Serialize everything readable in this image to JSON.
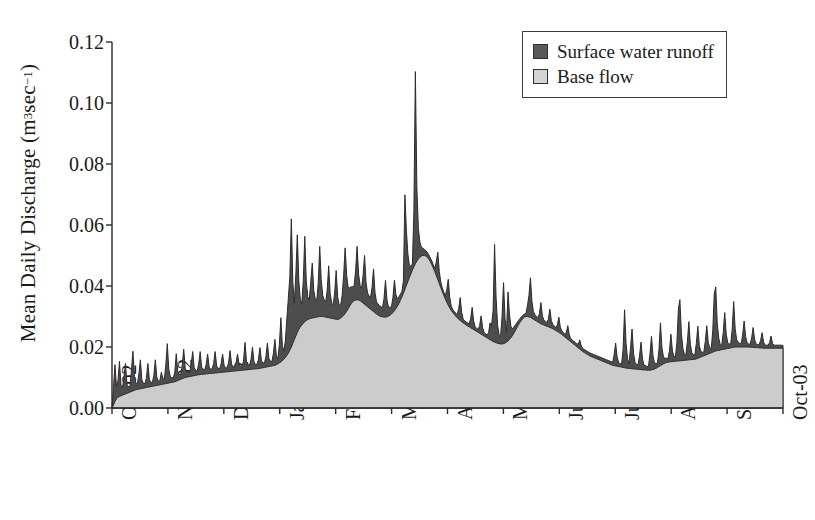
{
  "chart_data": {
    "type": "area",
    "title": "",
    "xlabel": "",
    "ylabel_text": "Mean Daily Discharge (m",
    "ylabel_unit_exp1": "3",
    "ylabel_unit_mid": " sec",
    "ylabel_unit_exp2": "−1",
    "ylabel_close": ")",
    "ylabel_full": "Mean Daily Discharge (m3 sec-1)",
    "ylim": [
      0.0,
      0.12
    ],
    "ytick_labels": [
      "0.12",
      "0.10",
      "0.08",
      "0.06",
      "0.04",
      "0.02",
      "0.00"
    ],
    "ytick_values": [
      0.12,
      0.1,
      0.08,
      0.06,
      0.04,
      0.02,
      0.0
    ],
    "xtick_labels": [
      "Oct-02",
      "Nov-02",
      "Dec-02",
      "Jan-03",
      "Feb-03",
      "Mar-03",
      "Apr-03",
      "May-03",
      "Jun-03",
      "Jul-03",
      "Aug-03",
      "Sep-03",
      "Oct-03"
    ],
    "grid": false,
    "legend_position": "top-right",
    "legend": [
      {
        "label": "Surface water runoff",
        "color": "#595959"
      },
      {
        "label": "Base flow",
        "color": "#d4d4d4"
      }
    ],
    "series": [
      {
        "name": "Base flow",
        "color": "#cccccc",
        "stack_order": 1,
        "values": [
          0.0,
          0.001,
          0.0022,
          0.003,
          0.0035,
          0.0038,
          0.004,
          0.0042,
          0.0044,
          0.0046,
          0.0048,
          0.005,
          0.0052,
          0.0054,
          0.0056,
          0.0058,
          0.006,
          0.0061,
          0.0062,
          0.0063,
          0.0064,
          0.0065,
          0.0066,
          0.0067,
          0.0068,
          0.0069,
          0.007,
          0.0071,
          0.0072,
          0.0073,
          0.0074,
          0.0075,
          0.0076,
          0.0077,
          0.0078,
          0.0079,
          0.008,
          0.0081,
          0.0082,
          0.0083,
          0.0084,
          0.0085,
          0.0086,
          0.0088,
          0.009,
          0.0092,
          0.0094,
          0.0096,
          0.0098,
          0.01,
          0.0101,
          0.0102,
          0.0103,
          0.0104,
          0.0105,
          0.0106,
          0.0107,
          0.0108,
          0.0109,
          0.011,
          0.011,
          0.0111,
          0.0111,
          0.0112,
          0.0112,
          0.0113,
          0.0113,
          0.0114,
          0.0114,
          0.0115,
          0.0115,
          0.0116,
          0.0116,
          0.0117,
          0.0117,
          0.0118,
          0.0118,
          0.0119,
          0.0119,
          0.012,
          0.012,
          0.0121,
          0.0121,
          0.0122,
          0.0122,
          0.0123,
          0.0123,
          0.0124,
          0.0124,
          0.0125,
          0.0125,
          0.0126,
          0.0126,
          0.0127,
          0.0127,
          0.0128,
          0.0128,
          0.0129,
          0.0129,
          0.013,
          0.0131,
          0.0132,
          0.0133,
          0.0134,
          0.0135,
          0.0136,
          0.0137,
          0.0138,
          0.0139,
          0.014,
          0.0142,
          0.0145,
          0.0148,
          0.0151,
          0.0155,
          0.016,
          0.0165,
          0.0172,
          0.018,
          0.019,
          0.02,
          0.0212,
          0.0224,
          0.0236,
          0.0248,
          0.0258,
          0.0266,
          0.0272,
          0.0278,
          0.0283,
          0.0287,
          0.029,
          0.0292,
          0.0294,
          0.0295,
          0.0296,
          0.0297,
          0.0298,
          0.0299,
          0.03,
          0.03,
          0.03,
          0.0299,
          0.0298,
          0.0297,
          0.0296,
          0.0295,
          0.0294,
          0.0293,
          0.0292,
          0.0291,
          0.029,
          0.0292,
          0.0295,
          0.0299,
          0.0304,
          0.031,
          0.0317,
          0.0325,
          0.0334,
          0.0342,
          0.0348,
          0.0352,
          0.0354,
          0.0355,
          0.0354,
          0.0352,
          0.0348,
          0.0344,
          0.034,
          0.0336,
          0.0332,
          0.0328,
          0.0324,
          0.032,
          0.0316,
          0.0312,
          0.0308,
          0.0305,
          0.0302,
          0.03,
          0.0299,
          0.0298,
          0.0298,
          0.0299,
          0.0301,
          0.0304,
          0.0308,
          0.0313,
          0.0319,
          0.0326,
          0.0334,
          0.0343,
          0.0353,
          0.0364,
          0.0376,
          0.0389,
          0.0402,
          0.0415,
          0.0428,
          0.044,
          0.0452,
          0.0463,
          0.0473,
          0.0482,
          0.0489,
          0.0494,
          0.0498,
          0.05,
          0.05,
          0.0498,
          0.0494,
          0.0488,
          0.048,
          0.047,
          0.0459,
          0.0447,
          0.0434,
          0.0421,
          0.0408,
          0.0395,
          0.0382,
          0.037,
          0.0358,
          0.0347,
          0.0337,
          0.0328,
          0.032,
          0.0313,
          0.0307,
          0.0301,
          0.0296,
          0.0291,
          0.0287,
          0.0283,
          0.0279,
          0.0276,
          0.0272,
          0.0269,
          0.0266,
          0.0263,
          0.026,
          0.0257,
          0.0254,
          0.0251,
          0.0248,
          0.0245,
          0.0242,
          0.0239,
          0.0236,
          0.0233,
          0.023,
          0.0227,
          0.0224,
          0.0221,
          0.0218,
          0.0216,
          0.0214,
          0.0212,
          0.0211,
          0.021,
          0.021,
          0.0211,
          0.0213,
          0.0216,
          0.022,
          0.0225,
          0.0231,
          0.0238,
          0.0246,
          0.0255,
          0.0264,
          0.0273,
          0.0281,
          0.0288,
          0.0294,
          0.0298,
          0.03,
          0.03,
          0.0299,
          0.0297,
          0.0294,
          0.0291,
          0.0288,
          0.0285,
          0.0282,
          0.0279,
          0.0276,
          0.0274,
          0.0272,
          0.027,
          0.0268,
          0.0266,
          0.0264,
          0.0262,
          0.026,
          0.0257,
          0.0254,
          0.0251,
          0.0248,
          0.0245,
          0.0241,
          0.0237,
          0.0233,
          0.0229,
          0.0225,
          0.0221,
          0.0217,
          0.0213,
          0.0209,
          0.0205,
          0.0201,
          0.0197,
          0.0193,
          0.0189,
          0.0185,
          0.0182,
          0.0179,
          0.0176,
          0.0173,
          0.017,
          0.0168,
          0.0166,
          0.0164,
          0.0162,
          0.016,
          0.0158,
          0.0156,
          0.0154,
          0.0152,
          0.015,
          0.0148,
          0.0146,
          0.0144,
          0.0142,
          0.014,
          0.0139,
          0.0138,
          0.0137,
          0.0136,
          0.0135,
          0.0134,
          0.0133,
          0.0132,
          0.0131,
          0.013,
          0.013,
          0.0129,
          0.0129,
          0.0128,
          0.0128,
          0.0127,
          0.0127,
          0.0126,
          0.0126,
          0.0125,
          0.0125,
          0.0125,
          0.0124,
          0.0124,
          0.0124,
          0.0125,
          0.0126,
          0.0128,
          0.013,
          0.0133,
          0.0136,
          0.0139,
          0.0142,
          0.0145,
          0.0147,
          0.0149,
          0.015,
          0.0151,
          0.0152,
          0.0152,
          0.0153,
          0.0153,
          0.0154,
          0.0154,
          0.0155,
          0.0155,
          0.0156,
          0.0156,
          0.0157,
          0.0157,
          0.0158,
          0.0158,
          0.0159,
          0.0159,
          0.016,
          0.0161,
          0.0163,
          0.0165,
          0.0167,
          0.0169,
          0.0171,
          0.0173,
          0.0175,
          0.0177,
          0.0179,
          0.0181,
          0.0183,
          0.0185,
          0.0187,
          0.0188,
          0.0189,
          0.019,
          0.0191,
          0.0192,
          0.0193,
          0.0194,
          0.0195,
          0.0196,
          0.0197,
          0.0198,
          0.0199,
          0.02,
          0.02,
          0.02,
          0.02,
          0.02,
          0.02,
          0.02,
          0.02,
          0.02,
          0.02,
          0.0199,
          0.0199,
          0.0199,
          0.0198,
          0.0198,
          0.0198,
          0.0197,
          0.0197,
          0.0197,
          0.0196,
          0.0196,
          0.0196,
          0.0196,
          0.0196,
          0.0196,
          0.0196,
          0.0196,
          0.0196,
          0.0196,
          0.0196,
          0.0196,
          0.0196,
          0.0195
        ]
      },
      {
        "name": "Surface water runoff",
        "color": "#4d4d4d",
        "stack_order": 2,
        "values": [
          0.0,
          0.006,
          0.012,
          0.004,
          0.0055,
          0.0115,
          0.0035,
          0.0025,
          0.0055,
          0.01,
          0.003,
          0.002,
          0.0018,
          0.007,
          0.013,
          0.0045,
          0.0022,
          0.0018,
          0.005,
          0.0095,
          0.0028,
          0.0016,
          0.0014,
          0.003,
          0.0078,
          0.0025,
          0.0014,
          0.0012,
          0.0035,
          0.0085,
          0.0026,
          0.0014,
          0.0012,
          0.004,
          0.002,
          0.0014,
          0.006,
          0.013,
          0.0045,
          0.002,
          0.0016,
          0.0014,
          0.003,
          0.009,
          0.003,
          0.0018,
          0.0016,
          0.0045,
          0.0095,
          0.003,
          0.0018,
          0.0016,
          0.0014,
          0.004,
          0.008,
          0.0026,
          0.0016,
          0.0014,
          0.0035,
          0.0075,
          0.0024,
          0.0016,
          0.0014,
          0.003,
          0.0065,
          0.0022,
          0.0014,
          0.0014,
          0.0032,
          0.007,
          0.0024,
          0.0014,
          0.0012,
          0.0028,
          0.006,
          0.0022,
          0.0014,
          0.0012,
          0.003,
          0.0068,
          0.0024,
          0.0014,
          0.0012,
          0.0026,
          0.0055,
          0.002,
          0.0014,
          0.0012,
          0.003,
          0.009,
          0.0028,
          0.0016,
          0.0014,
          0.0032,
          0.0072,
          0.0024,
          0.0014,
          0.0014,
          0.003,
          0.0068,
          0.0024,
          0.0016,
          0.0014,
          0.0035,
          0.0078,
          0.0026,
          0.0016,
          0.0014,
          0.004,
          0.0085,
          0.0028,
          0.0018,
          0.006,
          0.0145,
          0.005,
          0.0025,
          0.0055,
          0.012,
          0.018,
          0.024,
          0.042,
          0.02,
          0.012,
          0.02,
          0.032,
          0.016,
          0.009,
          0.007,
          0.014,
          0.028,
          0.013,
          0.0075,
          0.006,
          0.012,
          0.018,
          0.009,
          0.006,
          0.0055,
          0.011,
          0.023,
          0.012,
          0.007,
          0.0055,
          0.005,
          0.009,
          0.017,
          0.008,
          0.005,
          0.0045,
          0.0085,
          0.016,
          0.0075,
          0.0045,
          0.0042,
          0.007,
          0.013,
          0.0215,
          0.012,
          0.007,
          0.006,
          0.0055,
          0.005,
          0.0048,
          0.0095,
          0.0175,
          0.0085,
          0.005,
          0.0045,
          0.009,
          0.016,
          0.0075,
          0.0045,
          0.004,
          0.0038,
          0.0075,
          0.014,
          0.0065,
          0.004,
          0.0036,
          0.0034,
          0.0032,
          0.003,
          0.006,
          0.012,
          0.0055,
          0.003,
          0.0026,
          0.0024,
          0.005,
          0.01,
          0.0045,
          0.0024,
          0.0022,
          0.002,
          0.0018,
          0.004,
          0.031,
          0.018,
          0.009,
          0.004,
          0.0025,
          0.002,
          0.018,
          0.063,
          0.024,
          0.01,
          0.005,
          0.003,
          0.0024,
          0.002,
          0.0018,
          0.0016,
          0.0014,
          0.0012,
          0.0012,
          0.001,
          0.001,
          0.0045,
          0.009,
          0.004,
          0.0018,
          0.0012,
          0.001,
          0.001,
          0.004,
          0.0085,
          0.0035,
          0.0014,
          0.001,
          0.001,
          0.001,
          0.001,
          0.0035,
          0.0075,
          0.003,
          0.0012,
          0.001,
          0.001,
          0.001,
          0.001,
          0.003,
          0.007,
          0.0028,
          0.0012,
          0.001,
          0.001,
          0.0025,
          0.006,
          0.0024,
          0.0012,
          0.001,
          0.001,
          0.002,
          0.0055,
          0.005,
          0.01,
          0.032,
          0.015,
          0.006,
          0.003,
          0.0024,
          0.009,
          0.02,
          0.008,
          0.0035,
          0.016,
          0.008,
          0.0035,
          0.0022,
          0.002,
          0.0018,
          0.0016,
          0.0014,
          0.0012,
          0.0012,
          0.001,
          0.001,
          0.001,
          0.0035,
          0.007,
          0.013,
          0.0055,
          0.0025,
          0.0018,
          0.0016,
          0.0014,
          0.003,
          0.007,
          0.0028,
          0.0016,
          0.0014,
          0.0012,
          0.0025,
          0.006,
          0.0024,
          0.0014,
          0.0012,
          0.001,
          0.002,
          0.005,
          0.002,
          0.0012,
          0.001,
          0.001,
          0.0018,
          0.0045,
          0.0018,
          0.001,
          0.001,
          0.001,
          0.001,
          0.001,
          0.0012,
          0.003,
          0.0014,
          0.001,
          0.001,
          0.001,
          0.001,
          0.001,
          0.001,
          0.001,
          0.001,
          0.001,
          0.001,
          0.001,
          0.001,
          0.001,
          0.001,
          0.001,
          0.001,
          0.001,
          0.001,
          0.001,
          0.001,
          0.001,
          0.0035,
          0.0075,
          0.003,
          0.0014,
          0.001,
          0.001,
          0.006,
          0.019,
          0.008,
          0.003,
          0.0016,
          0.007,
          0.013,
          0.005,
          0.0022,
          0.0016,
          0.0014,
          0.0045,
          0.009,
          0.0035,
          0.0016,
          0.0014,
          0.0012,
          0.0012,
          0.0055,
          0.011,
          0.0045,
          0.002,
          0.0016,
          0.0014,
          0.0055,
          0.014,
          0.0055,
          0.0022,
          0.0016,
          0.0014,
          0.0012,
          0.0035,
          0.009,
          0.0035,
          0.0016,
          0.0014,
          0.006,
          0.017,
          0.02,
          0.009,
          0.004,
          0.002,
          0.0016,
          0.006,
          0.0125,
          0.005,
          0.0022,
          0.0016,
          0.0014,
          0.005,
          0.0105,
          0.004,
          0.0018,
          0.0014,
          0.0012,
          0.0045,
          0.0095,
          0.0038,
          0.0018,
          0.0014,
          0.007,
          0.019,
          0.021,
          0.009,
          0.004,
          0.0018,
          0.0014,
          0.0055,
          0.012,
          0.0048,
          0.002,
          0.0014,
          0.0012,
          0.006,
          0.015,
          0.006,
          0.0024,
          0.0016,
          0.0012,
          0.001,
          0.004,
          0.0085,
          0.0034,
          0.0014,
          0.001,
          0.001,
          0.003,
          0.0065,
          0.0026,
          0.0012,
          0.001,
          0.001,
          0.0024,
          0.005,
          0.002,
          0.001,
          0.001,
          0.001,
          0.0018,
          0.004,
          0.0016,
          0.001,
          0.001,
          0.001,
          0.001,
          0.001,
          0.001,
          0.001
        ]
      }
    ],
    "axes": {
      "x_px_start": 112,
      "x_px_end": 783,
      "y_px_zero": 408,
      "y_px_top": 42,
      "tick_len": 6
    }
  }
}
